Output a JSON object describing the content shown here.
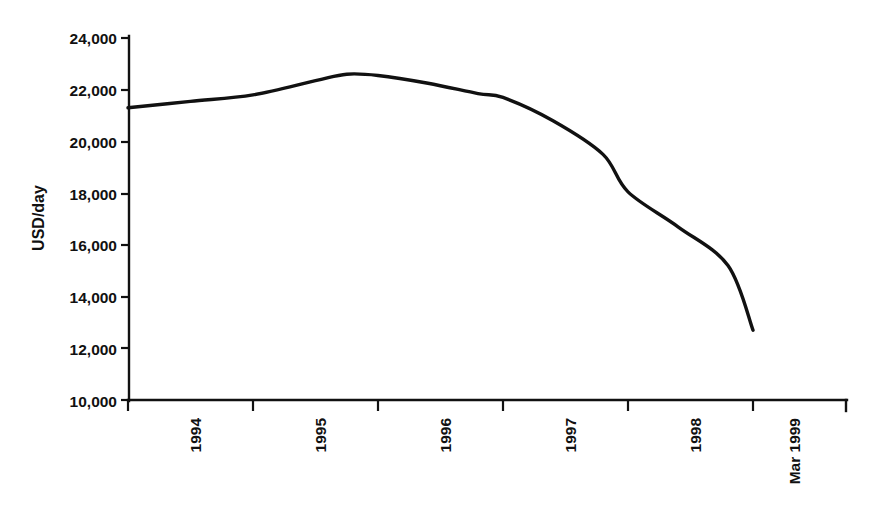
{
  "chart_data": {
    "type": "line",
    "title": "",
    "subtitle": "",
    "xlabel": "",
    "ylabel": "USD/day",
    "ylim": [
      10000,
      24000
    ],
    "ytick_step": 2000,
    "yticks": [
      10000,
      12000,
      14000,
      16000,
      18000,
      20000,
      22000,
      24000
    ],
    "ytick_labels": [
      "10,000",
      "12,000",
      "14,000",
      "16,000",
      "18,000",
      "20,000",
      "22,000",
      "24,000"
    ],
    "categories": [
      "1994",
      "1995",
      "1996",
      "1997",
      "1998",
      "Mar 1999"
    ],
    "xtick_labels": [
      "1994",
      "1995",
      "1996",
      "1997",
      "1998",
      "Mar 1999"
    ],
    "xtick_label_rotation": -90,
    "grid": false,
    "legend": false,
    "legend_position": "none",
    "series": [
      {
        "name": "USD/day",
        "color": "#111111",
        "x": [
          "1994",
          "1994.5",
          "1995",
          "1995.5",
          "1995.75",
          "1996",
          "1996.4",
          "1996.8",
          "1997",
          "1997.4",
          "1997.8",
          "1998",
          "1998.4",
          "1998.8",
          "Mar 1999"
        ],
        "values": [
          21300,
          21550,
          21800,
          22350,
          22600,
          22550,
          22250,
          21850,
          21700,
          20800,
          19500,
          18050,
          16700,
          15200,
          12700
        ]
      }
    ],
    "annotations": []
  },
  "axes": {
    "y_axis_name": "y-axis",
    "x_axis_name": "x-axis",
    "y_title": "USD/day"
  }
}
